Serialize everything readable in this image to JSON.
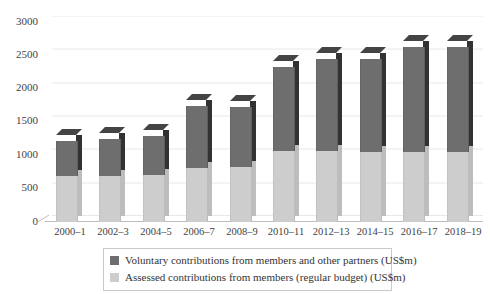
{
  "chart_data": {
    "type": "bar",
    "stacked": true,
    "title": "",
    "subtitle": "",
    "xlabel": "",
    "ylabel": "",
    "ylim": [
      0,
      3000
    ],
    "ytick_step": 500,
    "yticks": [
      "0",
      "500",
      "1000",
      "1500",
      "2000",
      "2500",
      "3000"
    ],
    "grid": true,
    "legend_position": "bottom",
    "categories": [
      "2000–1",
      "2002–3",
      "2004–5",
      "2006–7",
      "2008–9",
      "2010–11",
      "2012–13",
      "2014–15",
      "2016–17",
      "2018–19"
    ],
    "series": [
      {
        "name": "Assessed contributions from members (regular budget) (US$m)",
        "color": "#cdcdcd",
        "values": [
          690,
          690,
          710,
          810,
          820,
          1065,
          1060,
          1050,
          1050,
          1055
        ]
      },
      {
        "name": "Voluntary contributions from members and other partners (US$m)",
        "color": "#6e6e6e",
        "values": [
          525,
          560,
          575,
          930,
          900,
          1260,
          1380,
          1390,
          1575,
          1570
        ]
      }
    ],
    "totals": [
      1215,
      1250,
      1285,
      1740,
      1720,
      2325,
      2440,
      2440,
      2625,
      2625
    ]
  },
  "legend": {
    "items": [
      {
        "swatch": "#6e6e6e",
        "label": "Voluntary contributions from members and other partners (US$m)"
      },
      {
        "swatch": "#cdcdcd",
        "label": "Assessed contributions from members (regular budget) (US$m)"
      }
    ]
  },
  "colors": {
    "voluntary": "#6e6e6e",
    "assessed": "#cdcdcd",
    "voluntary_side": "#262626",
    "assessed_side": "#bcbcbc",
    "gridline": "#e8e8e8",
    "axis": "#bdbdbd"
  }
}
